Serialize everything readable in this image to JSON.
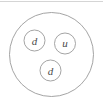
{
  "figure": {
    "name": "neutron-quark-composition",
    "background_color": "#ffffff",
    "border": {
      "top_rule_color": "#d5d5d5"
    },
    "outer_circle": {
      "label": "",
      "cx": 51.5,
      "cy": 54.5,
      "r": 42,
      "stroke_color": "#9a9a9a",
      "fill_color": "#ffffff"
    },
    "quarks": [
      {
        "id": "quark-left",
        "label": "d",
        "cx": 34.5,
        "cy": 40.5,
        "r": 10.5,
        "stroke_color": "#9a9a9a",
        "fill_color": "#ffffff",
        "text_color": "#4a4a4a"
      },
      {
        "id": "quark-right",
        "label": "u",
        "cx": 65,
        "cy": 43.5,
        "r": 10.5,
        "stroke_color": "#9a9a9a",
        "fill_color": "#ffffff",
        "text_color": "#4a4a4a"
      },
      {
        "id": "quark-bottom",
        "label": "d",
        "cx": 50.5,
        "cy": 70.5,
        "r": 10.5,
        "stroke_color": "#9a9a9a",
        "fill_color": "#ffffff",
        "text_color": "#4a4a4a"
      }
    ]
  }
}
